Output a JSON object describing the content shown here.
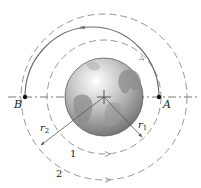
{
  "diagram": {
    "center": {
      "x": 104,
      "y": 97
    },
    "earth": {
      "radius": 39,
      "label": ""
    },
    "orbits": [
      {
        "id": "1",
        "label": "1",
        "radius": 57,
        "style": "dashed",
        "direction": "counterclockwise"
      },
      {
        "id": "2",
        "label": "2",
        "radius": 83,
        "style": "dashed",
        "direction": "counterclockwise"
      }
    ],
    "transfer_orbit": {
      "from": "A",
      "to": "B",
      "style": "solid",
      "shape": "half-ellipse"
    },
    "points": [
      {
        "label": "A",
        "x": 159,
        "y": 97
      },
      {
        "label": "B",
        "x": 25,
        "y": 97
      }
    ],
    "dimensions": [
      {
        "label": "r",
        "sub": "1",
        "to": {
          "x": 142,
          "y": 137
        }
      },
      {
        "label": "r",
        "sub": "2",
        "to": {
          "x": 41,
          "y": 145
        }
      }
    ],
    "labels": {
      "A": "A",
      "B": "B",
      "r1": "r",
      "r1_sub": "1",
      "r2": "r",
      "r2_sub": "2",
      "orbit1": "1",
      "orbit2": "2"
    },
    "colors": {
      "line": "#6a6a6a",
      "dashed": "#8a8a8a",
      "earth_light": "#e8e8e8",
      "earth_dark": "#7a7a7a",
      "text": "#222222"
    }
  }
}
